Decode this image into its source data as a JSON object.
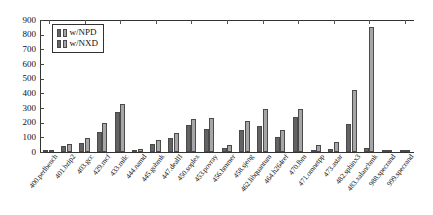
{
  "chart_data": {
    "type": "bar",
    "title": "",
    "xlabel": "",
    "ylabel": "",
    "ylim": [
      0,
      900
    ],
    "yticks": [
      0,
      100,
      200,
      300,
      400,
      500,
      600,
      700,
      800,
      900
    ],
    "grid": false,
    "legend_position": "top-left",
    "categories": [
      "400.perlbench",
      "401.bzip2",
      "403.gcc",
      "429.mcf",
      "433.milc",
      "444.namd",
      "445.gobmk",
      "447.dealII",
      "450.soplex",
      "453.povray",
      "456.hmmer",
      "458.sjeng",
      "462.libquantum",
      "464.h264ref",
      "470.lbm",
      "471.omnetpp",
      "473.astar",
      "482.sphinx3",
      "483.xalancbmk",
      "988.specrand",
      "999.specrand"
    ],
    "series": [
      {
        "name": "w/NPD",
        "color": "#636363",
        "values": [
          8,
          38,
          60,
          135,
          275,
          10,
          55,
          95,
          185,
          155,
          25,
          150,
          175,
          100,
          240,
          15,
          20,
          190,
          30,
          3,
          2
        ]
      },
      {
        "name": "w/NXD",
        "color": "#a6a6a6",
        "values": [
          14,
          55,
          95,
          195,
          330,
          22,
          80,
          130,
          225,
          235,
          45,
          210,
          290,
          150,
          290,
          45,
          70,
          425,
          120,
          6,
          4
        ]
      }
    ],
    "annotations": [
      {
        "category": "483.xalancbmk",
        "series": "w/NXD",
        "value": 855
      }
    ]
  },
  "legend": {
    "items": [
      {
        "label": "w/NPD"
      },
      {
        "label": "w/NXD"
      }
    ]
  },
  "axis": {
    "y_tick_labels": [
      "900",
      "800",
      "700",
      "600",
      "500",
      "400",
      "300",
      "200",
      "100",
      "0"
    ]
  }
}
